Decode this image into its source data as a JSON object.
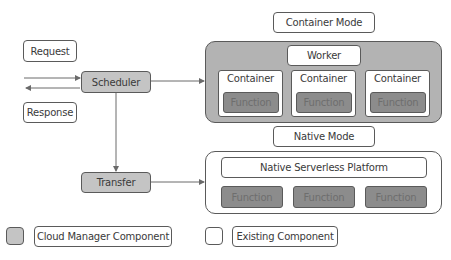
{
  "request_label": "Request",
  "response_label": "Response",
  "scheduler_label": "Scheduler",
  "transfer_label": "Transfer",
  "container_mode": {
    "title": "Container Mode",
    "worker_label": "Worker",
    "containers": [
      {
        "label": "Container",
        "function_label": "Function"
      },
      {
        "label": "Container",
        "function_label": "Function"
      },
      {
        "label": "Container",
        "function_label": "Function"
      }
    ]
  },
  "native_mode": {
    "title": "Native Mode",
    "platform_label": "Native Serverless Platform",
    "functions": [
      "Function",
      "Function",
      "Function"
    ]
  },
  "legend": {
    "cloud_manager": "Cloud Manager Component",
    "existing": "Existing Component"
  },
  "colors": {
    "cloud_manager_fill": "#c4c4c4",
    "function_fill": "#8c8c8c",
    "worker_group_fill": "#b3b3b3",
    "line": "#5a5a5a"
  }
}
